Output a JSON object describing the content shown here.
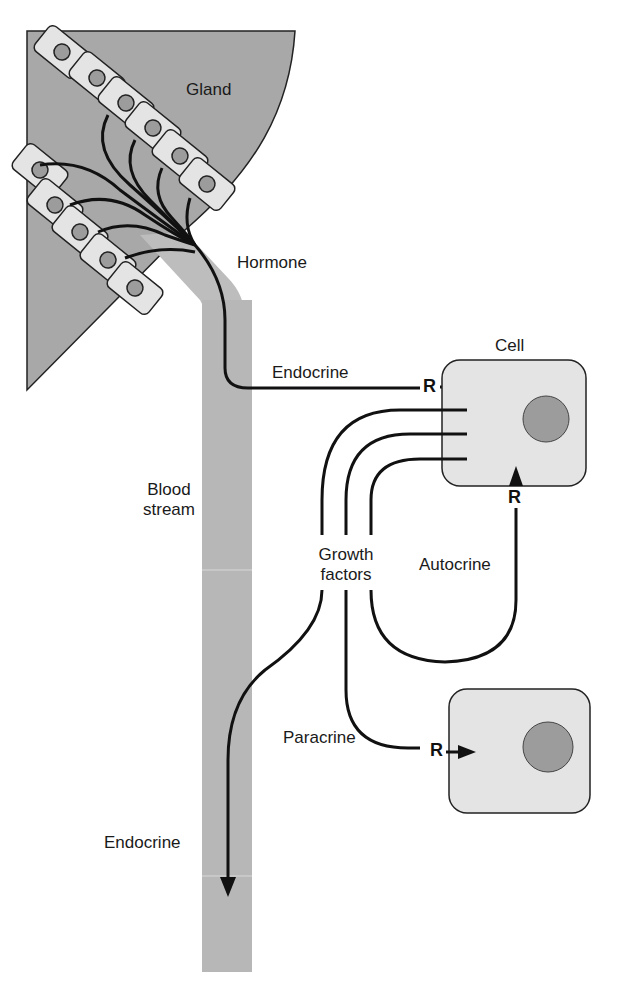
{
  "diagram": {
    "labels": {
      "gland": "Gland",
      "hormone": "Hormone",
      "endocrine_top": "Endocrine",
      "cell": "Cell",
      "blood_stream_line1": "Blood",
      "blood_stream_line2": "stream",
      "growth_factors_line1": "Growth",
      "growth_factors_line2": "factors",
      "autocrine": "Autocrine",
      "paracrine": "Paracrine",
      "endocrine_bottom": "Endocrine"
    },
    "receptors": {
      "endocrine_receptor": "R",
      "autocrine_receptor": "R",
      "paracrine_receptor": "R"
    },
    "colors": {
      "gland_fill": "#a8a8a8",
      "cell_fill": "#e4e4e4",
      "blood_stream_fill": "#b7b7b7",
      "nucleus_fill": "#9c9c9c",
      "stroke": "#111111"
    }
  }
}
